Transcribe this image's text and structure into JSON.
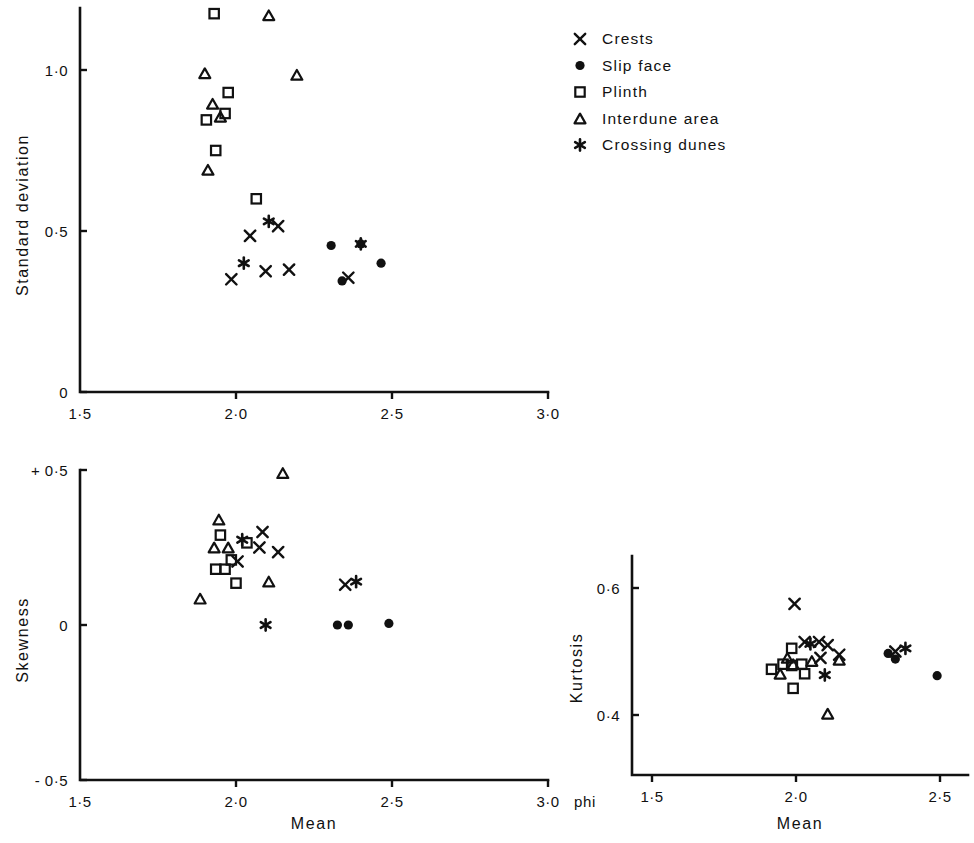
{
  "figure": {
    "background": "#ffffff",
    "ink": "#111111",
    "unit_label": "phi"
  },
  "legend": {
    "items": [
      {
        "marker": "cross-x-marker",
        "label": "Crests"
      },
      {
        "marker": "filled-circle-marker",
        "label": "Slip face"
      },
      {
        "marker": "open-square-marker",
        "label": "Plinth"
      },
      {
        "marker": "open-triangle-marker",
        "label": "Interdune area"
      },
      {
        "marker": "asterisk-marker",
        "label": "Crossing dunes"
      }
    ]
  },
  "chart_data": [
    {
      "id": "standard-deviation-vs-mean",
      "type": "scatter",
      "title": "",
      "xlabel": "Mean",
      "ylabel": "Standard deviation",
      "xlim": [
        1.5,
        3.0
      ],
      "ylim": [
        0.0,
        1.2
      ],
      "xticks": [
        1.5,
        2.0,
        2.5,
        3.0
      ],
      "xticklabels": [
        "1·5",
        "2·0",
        "2·5",
        "3·0"
      ],
      "yticks": [
        0.0,
        0.5,
        1.0
      ],
      "yticklabels": [
        "0",
        "0·5",
        "1·0"
      ],
      "grid": false,
      "legend_position": "upper right (shared)",
      "series": [
        {
          "name": "Crests",
          "marker": "cross-x-marker",
          "points": [
            [
              2.045,
              0.485
            ],
            [
              2.095,
              0.375
            ],
            [
              2.135,
              0.515
            ],
            [
              2.17,
              0.38
            ],
            [
              1.985,
              0.35
            ],
            [
              2.36,
              0.355
            ]
          ]
        },
        {
          "name": "Slip face",
          "marker": "filled-circle-marker",
          "points": [
            [
              2.305,
              0.455
            ],
            [
              2.34,
              0.345
            ],
            [
              2.4,
              0.46
            ],
            [
              2.465,
              0.4
            ]
          ]
        },
        {
          "name": "Plinth",
          "marker": "open-square-marker",
          "points": [
            [
              1.93,
              1.175
            ],
            [
              1.975,
              0.93
            ],
            [
              1.965,
              0.865
            ],
            [
              1.905,
              0.845
            ],
            [
              1.935,
              0.75
            ],
            [
              2.065,
              0.6
            ]
          ]
        },
        {
          "name": "Interdune area",
          "marker": "open-triangle-marker",
          "points": [
            [
              2.105,
              1.17
            ],
            [
              1.9,
              0.99
            ],
            [
              1.925,
              0.895
            ],
            [
              1.95,
              0.855
            ],
            [
              1.91,
              0.69
            ],
            [
              2.195,
              0.985
            ]
          ]
        },
        {
          "name": "Crossing dunes",
          "marker": "asterisk-marker",
          "points": [
            [
              2.105,
              0.53
            ],
            [
              2.025,
              0.4
            ],
            [
              2.4,
              0.46
            ]
          ]
        }
      ]
    },
    {
      "id": "skewness-vs-mean",
      "type": "scatter",
      "title": "",
      "xlabel": "Mean",
      "ylabel": "Skewness",
      "xlim": [
        1.5,
        3.0
      ],
      "ylim": [
        -0.5,
        0.5
      ],
      "xticks": [
        1.5,
        2.0,
        2.5,
        3.0
      ],
      "xticklabels": [
        "1·5",
        "2·0",
        "2·5",
        "3·0"
      ],
      "yticks": [
        -0.5,
        0.0,
        0.5
      ],
      "yticklabels": [
        "- 0·5",
        "0",
        "+ 0·5"
      ],
      "grid": false,
      "legend_position": "upper right (shared)",
      "series": [
        {
          "name": "Crests",
          "marker": "cross-x-marker",
          "points": [
            [
              2.085,
              0.3
            ],
            [
              2.075,
              0.25
            ],
            [
              2.135,
              0.235
            ],
            [
              2.005,
              0.205
            ],
            [
              2.35,
              0.13
            ]
          ]
        },
        {
          "name": "Slip face",
          "marker": "filled-circle-marker",
          "points": [
            [
              2.325,
              0.0
            ],
            [
              2.36,
              0.0
            ],
            [
              2.49,
              0.005
            ]
          ]
        },
        {
          "name": "Plinth",
          "marker": "open-square-marker",
          "points": [
            [
              1.95,
              0.29
            ],
            [
              2.035,
              0.265
            ],
            [
              1.985,
              0.21
            ],
            [
              1.935,
              0.18
            ],
            [
              1.965,
              0.18
            ],
            [
              2.0,
              0.135
            ]
          ]
        },
        {
          "name": "Interdune area",
          "marker": "open-triangle-marker",
          "points": [
            [
              2.15,
              0.49
            ],
            [
              1.945,
              0.34
            ],
            [
              1.93,
              0.25
            ],
            [
              1.975,
              0.25
            ],
            [
              2.105,
              0.14
            ],
            [
              1.885,
              0.085
            ]
          ]
        },
        {
          "name": "Crossing dunes",
          "marker": "asterisk-marker",
          "points": [
            [
              2.02,
              0.275
            ],
            [
              2.385,
              0.14
            ],
            [
              2.095,
              0.0
            ]
          ]
        }
      ]
    },
    {
      "id": "kurtosis-vs-mean",
      "type": "scatter",
      "title": "",
      "xlabel": "Mean",
      "ylabel": "Kurtosis",
      "xlim": [
        1.5,
        2.6
      ],
      "ylim": [
        0.33,
        0.63
      ],
      "xticks": [
        1.5,
        2.0,
        2.5
      ],
      "xticklabels": [
        "1·5",
        "2·0",
        "2·5"
      ],
      "yticks": [
        0.4,
        0.6
      ],
      "yticklabels": [
        "0·4",
        "0·6"
      ],
      "grid": false,
      "legend_position": "upper right (shared)",
      "series": [
        {
          "name": "Crests",
          "marker": "cross-x-marker",
          "points": [
            [
              1.995,
              0.575
            ],
            [
              2.03,
              0.515
            ],
            [
              2.08,
              0.515
            ],
            [
              2.11,
              0.51
            ],
            [
              2.085,
              0.49
            ],
            [
              2.15,
              0.495
            ],
            [
              2.345,
              0.5
            ]
          ]
        },
        {
          "name": "Slip face",
          "marker": "filled-circle-marker",
          "points": [
            [
              2.32,
              0.497
            ],
            [
              2.345,
              0.488
            ],
            [
              2.49,
              0.462
            ]
          ]
        },
        {
          "name": "Plinth",
          "marker": "open-square-marker",
          "points": [
            [
              1.985,
              0.505
            ],
            [
              1.955,
              0.48
            ],
            [
              1.915,
              0.472
            ],
            [
              1.985,
              0.478
            ],
            [
              2.02,
              0.48
            ],
            [
              2.03,
              0.465
            ],
            [
              1.99,
              0.442
            ]
          ]
        },
        {
          "name": "Interdune area",
          "marker": "open-triangle-marker",
          "points": [
            [
              1.97,
              0.49
            ],
            [
              1.99,
              0.48
            ],
            [
              1.945,
              0.465
            ],
            [
              2.055,
              0.485
            ],
            [
              2.15,
              0.487
            ],
            [
              2.11,
              0.402
            ]
          ]
        },
        {
          "name": "Crossing dunes",
          "marker": "asterisk-marker",
          "points": [
            [
              2.05,
              0.512
            ],
            [
              2.1,
              0.463
            ],
            [
              2.38,
              0.505
            ]
          ]
        }
      ]
    }
  ]
}
